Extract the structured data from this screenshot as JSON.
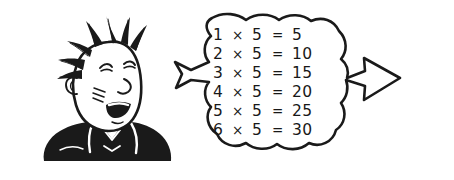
{
  "image": {
    "kind": "hand-drawn-cartoon-illustration",
    "background_color": "#ffffff",
    "ink_color": "#1a1a1a",
    "width": 454,
    "height": 180
  },
  "character": {
    "name": "spiky-haired-boy",
    "description": "Cartoon boy head and shoulders, smiling with closed eyes, punk spiky hair, dark jacket with white collar",
    "hair_style": "spiky",
    "expression": "smiling",
    "jacket_color": "#1a1a1a",
    "skin_color": "#ffffff"
  },
  "speech_bubble": {
    "name": "thought-bubble",
    "shape": "scalloped-rounded-rectangle",
    "fill_color": "#ffffff",
    "border_color": "#1a1a1a",
    "tail_direction": "left",
    "title": "",
    "rows": [
      {
        "multiplicand": "1",
        "operator": "×",
        "multiplier": "5",
        "equals": "=",
        "product": "5"
      },
      {
        "multiplicand": "2",
        "operator": "×",
        "multiplier": "5",
        "equals": "=",
        "product": "10"
      },
      {
        "multiplicand": "3",
        "operator": "×",
        "multiplier": "5",
        "equals": "=",
        "product": "15"
      },
      {
        "multiplicand": "4",
        "operator": "×",
        "multiplier": "5",
        "equals": "=",
        "product": "20"
      },
      {
        "multiplicand": "5",
        "operator": "×",
        "multiplier": "5",
        "equals": "=",
        "product": "25"
      },
      {
        "multiplicand": "6",
        "operator": "×",
        "multiplier": "5",
        "equals": "=",
        "product": "30"
      }
    ]
  },
  "arrow": {
    "name": "right-arrow",
    "direction": "right",
    "style": "outlined",
    "fill_color": "#ffffff",
    "border_color": "#1a1a1a"
  }
}
